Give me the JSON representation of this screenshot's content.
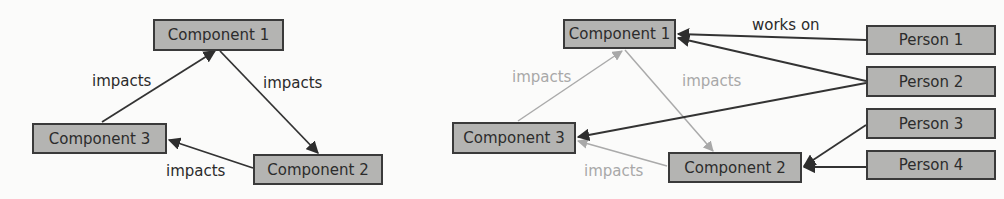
{
  "left_diagram": {
    "nodes": {
      "c1": "Component 1",
      "c2": "Component 2",
      "c3": "Component 3"
    },
    "edges": [
      {
        "from": "Component 1",
        "to": "Component 2",
        "label": "impacts"
      },
      {
        "from": "Component 2",
        "to": "Component 3",
        "label": "impacts"
      },
      {
        "from": "Component 3",
        "to": "Component 1",
        "label": "impacts"
      }
    ]
  },
  "right_diagram": {
    "nodes": {
      "c1": "Component 1",
      "c2": "Component 2",
      "c3": "Component 3",
      "p1": "Person 1",
      "p2": "Person 2",
      "p3": "Person 3",
      "p4": "Person 4"
    },
    "edges": [
      {
        "from": "Component 1",
        "to": "Component 2",
        "label": "impacts",
        "style": "faint"
      },
      {
        "from": "Component 2",
        "to": "Component 3",
        "label": "impacts",
        "style": "faint"
      },
      {
        "from": "Component 3",
        "to": "Component 1",
        "label": "impacts",
        "style": "faint"
      },
      {
        "from": "Person 1",
        "to": "Component 1",
        "label": "works on",
        "style": "dark"
      },
      {
        "from": "Person 2",
        "to": "Component 1",
        "label": "",
        "style": "dark"
      },
      {
        "from": "Person 2",
        "to": "Component 3",
        "label": "",
        "style": "dark"
      },
      {
        "from": "Person 3",
        "to": "Component 2",
        "label": "",
        "style": "dark"
      },
      {
        "from": "Person 4",
        "to": "Component 2",
        "label": "",
        "style": "dark"
      }
    ]
  },
  "colors": {
    "box_fill": "#b4b4b2",
    "box_border": "#3a3a3a",
    "dark_edge": "#333333",
    "faint_edge": "#aaaaaa"
  }
}
